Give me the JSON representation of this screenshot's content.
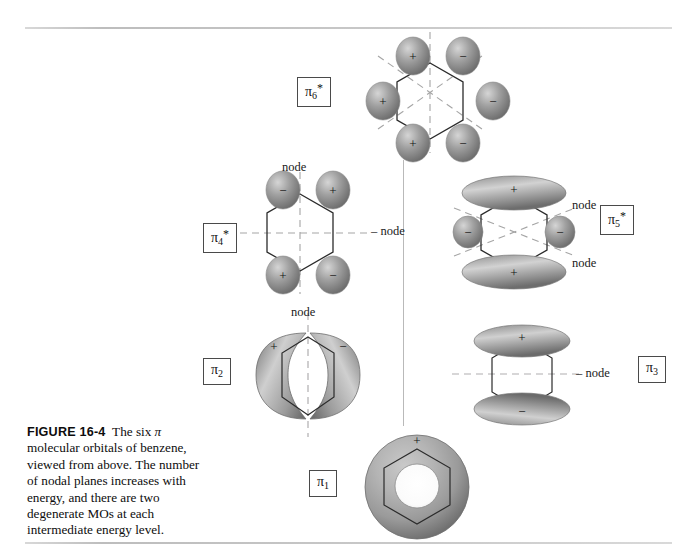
{
  "figure": {
    "number": "FIGURE 16-4",
    "caption_text": "The six π molecular orbitals of benzene, viewed from above. The number of nodal planes increases with energy, and there are two degenerate MOs at each intermediate energy level.",
    "caption_part1": "The six ",
    "caption_pi": "π",
    "caption_part2": " molecular orbitals of benzene, viewed from above. The number of nodal planes increases with energy, and there are two degenerate MOs at each intermediate energy level."
  },
  "colors": {
    "rule": "#c4c4c4",
    "divider": "#b9b9b9",
    "lobe_dark": "#6e6e6e",
    "lobe_mid": "#9a9a9a",
    "lobe_light": "#d7d7d7",
    "hexagon_line": "#2b2b2b",
    "node_line": "#9a9a9a",
    "label_border": "#4a4a4a",
    "text": "#111111"
  },
  "orbitals": [
    {
      "id": "pi6-star",
      "label_base": "π",
      "label_sub": "6",
      "label_star": "*",
      "energy_rank": 6,
      "nodes_count": 3,
      "node_labels": [],
      "signs": [
        "+",
        "−",
        "+",
        "−",
        "+",
        "−"
      ],
      "description": "six p-lobes on hexagon vertices, alternating signs, three nodal planes"
    },
    {
      "id": "pi4-star",
      "label_base": "π",
      "label_sub": "4",
      "label_star": "*",
      "energy_rank": 4,
      "nodes_count": 2,
      "node_labels": [
        "node",
        "node"
      ],
      "signs": [
        "−",
        "+",
        "+",
        "−"
      ],
      "description": "four lobes at top-left, top-right, bottom-left, bottom-right; vertical and horizontal nodes"
    },
    {
      "id": "pi5-star",
      "label_base": "π",
      "label_sub": "5",
      "label_star": "*",
      "energy_rank": 5,
      "nodes_count": 2,
      "node_labels": [
        "node",
        "node"
      ],
      "signs": [
        "+",
        "−",
        "−",
        "+"
      ],
      "description": "large plus lobes top and bottom, small minus lobes left and right, two diagonal nodes"
    },
    {
      "id": "pi2",
      "label_base": "π",
      "label_sub": "2",
      "label_star": "",
      "energy_rank": 2,
      "nodes_count": 1,
      "node_labels": [
        "node"
      ],
      "signs": [
        "+",
        "−"
      ],
      "description": "two crescent lobes left plus and right minus, one vertical node"
    },
    {
      "id": "pi3",
      "label_base": "π",
      "label_sub": "3",
      "label_star": "",
      "energy_rank": 3,
      "nodes_count": 1,
      "node_labels": [
        "node"
      ],
      "signs": [
        "+",
        "−"
      ],
      "description": "plus ellipse on top, minus ellipse on bottom, one horizontal node"
    },
    {
      "id": "pi1",
      "label_base": "π",
      "label_sub": "1",
      "label_star": "",
      "energy_rank": 1,
      "nodes_count": 0,
      "node_labels": [],
      "signs": [
        "+"
      ],
      "description": "continuous torus ring above and below hexagon, all one sign"
    }
  ]
}
